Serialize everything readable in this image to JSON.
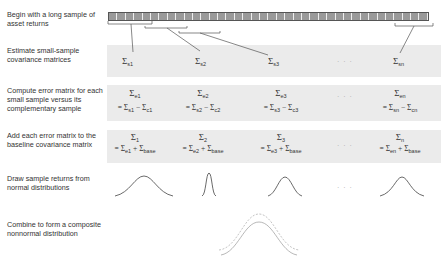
{
  "steps": [
    {
      "label": "Begin with a long sample of asset returns"
    },
    {
      "label": "Estimate small-sample covariance matrices"
    },
    {
      "label": "Compute error matrix for each small sample versus its complementary sample"
    },
    {
      "label": "Add each error matrix to the baseline covariance matrix"
    },
    {
      "label": "Draw sample returns from normal distributions"
    },
    {
      "label": "Combine to form a composite nonnormal distribution"
    }
  ],
  "sample_bar": {
    "segments": 38,
    "fill": "#9a9a9a"
  },
  "row_small_sample": {
    "cells": [
      {
        "sym": "Σ",
        "sub": "s1"
      },
      {
        "sym": "Σ",
        "sub": "s2"
      },
      {
        "sym": "Σ",
        "sub": "s3"
      },
      {
        "sym": "Σ",
        "sub": "sn"
      }
    ],
    "ellipsis": "· · ·"
  },
  "row_error": {
    "cells": [
      {
        "sym": "Σ",
        "sub": "e1",
        "eq_a": "s1",
        "eq_b": "c1"
      },
      {
        "sym": "Σ",
        "sub": "e2",
        "eq_a": "s2",
        "eq_b": "c2"
      },
      {
        "sym": "Σ",
        "sub": "e3",
        "eq_a": "s3",
        "eq_b": "c3"
      },
      {
        "sym": "Σ",
        "sub": "en",
        "eq_a": "sn",
        "eq_b": "cn"
      }
    ],
    "ellipsis": "· · ·"
  },
  "row_baseline": {
    "cells": [
      {
        "sym": "Σ",
        "sub": "1",
        "eq_a": "e1",
        "eq_b": "base"
      },
      {
        "sym": "Σ",
        "sub": "2",
        "eq_a": "e2",
        "eq_b": "base"
      },
      {
        "sym": "Σ",
        "sub": "3",
        "eq_a": "e3",
        "eq_b": "base"
      },
      {
        "sym": "Σ",
        "sub": "n",
        "eq_a": "en",
        "eq_b": "base"
      }
    ],
    "ellipsis": "· · ·"
  },
  "row_distributions": {
    "ellipsis": "· · ·"
  },
  "colors": {
    "band": "#ebebeb",
    "text": "#333333",
    "curve": "#444444",
    "composite": "#aaaaaa"
  }
}
